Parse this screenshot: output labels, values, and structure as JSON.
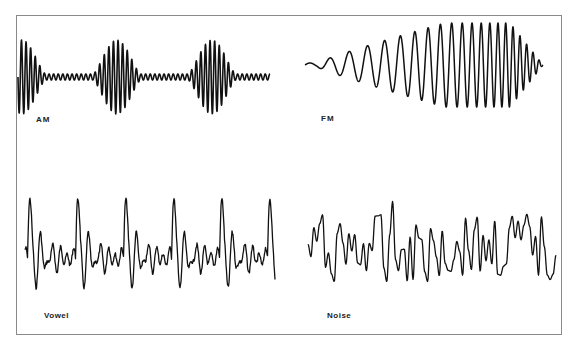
{
  "figure": {
    "panels": [
      {
        "id": "am",
        "label": "AM",
        "description": "Amplitude-modulated sine wave with periodic envelope bursts"
      },
      {
        "id": "fm",
        "label": "FM",
        "description": "Frequency-modulated wave with increasing frequency and amplitude, ending in a dense tapering envelope"
      },
      {
        "id": "vowel",
        "label": "Vowel",
        "description": "Quasi-periodic speech waveform with repeating pitch-period peaks"
      },
      {
        "id": "noise",
        "label": "Noise",
        "description": "Aperiodic random waveform"
      }
    ],
    "colors": {
      "stroke": "#111111",
      "frame": "#8a8a8a",
      "background": "#ffffff"
    }
  }
}
